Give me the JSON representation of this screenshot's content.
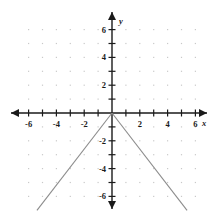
{
  "chart_data": {
    "type": "line",
    "title": "",
    "xlabel": "x",
    "ylabel": "y",
    "xlim": [
      -7,
      7
    ],
    "ylim": [
      -7,
      7
    ],
    "grid": true,
    "grid_style": "dots",
    "legend": "none",
    "x_tick_labels": [
      "-6",
      "-4",
      "-2",
      "2",
      "4",
      "6"
    ],
    "x_tick_values": [
      -6,
      -4,
      -2,
      2,
      4,
      6
    ],
    "y_tick_labels": [
      "6",
      "4",
      "2",
      "-2",
      "-4",
      "-6"
    ],
    "y_tick_values": [
      6,
      4,
      2,
      -2,
      -4,
      -6
    ],
    "minor_tick_values_x": [
      -7,
      -6,
      -5,
      -4,
      -3,
      -2,
      -1,
      1,
      2,
      3,
      4,
      5,
      6,
      7
    ],
    "minor_tick_values_y": [
      -7,
      -6,
      -5,
      -4,
      -3,
      -2,
      -1,
      1,
      2,
      3,
      4,
      5,
      6,
      7
    ],
    "series": [
      {
        "name": "left-branch",
        "points": [
          [
            -5.4,
            -7.0
          ],
          [
            0,
            0
          ]
        ]
      },
      {
        "name": "right-branch",
        "points": [
          [
            0,
            0
          ],
          [
            5.4,
            -7.0
          ]
        ]
      }
    ],
    "vertex": [
      0,
      0
    ]
  },
  "axes": {
    "x_axis_label": "x",
    "y_axis_label": "y",
    "origin_label": ""
  },
  "colors": {
    "background": "#ffffff",
    "axis": "#1a1a1a",
    "grid_dot": "#c9c9c9",
    "curve": "#8c8c8c",
    "text": "#1a1a1a"
  }
}
